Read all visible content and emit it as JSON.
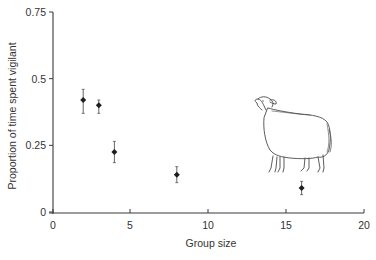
{
  "chart_data": {
    "type": "scatter",
    "title": "",
    "xlabel": "Group size",
    "ylabel": "Proportion of time spent vigilant",
    "xlim": [
      0,
      20
    ],
    "ylim": [
      0,
      0.75
    ],
    "x_ticks": [
      0,
      5,
      10,
      15,
      20
    ],
    "x_tick_labels": [
      "0",
      "5",
      "10",
      "15",
      "20"
    ],
    "y_ticks": [
      0,
      0.25,
      0.5,
      0.75
    ],
    "y_tick_labels": [
      "0",
      "0.25",
      "0.5",
      "0.75"
    ],
    "grid": false,
    "legend": null,
    "series": [
      {
        "name": "Vigilance",
        "marker": "diamond",
        "error_bars": true,
        "points": [
          {
            "x": 2,
            "y": 0.42,
            "err_low": 0.37,
            "err_high": 0.46
          },
          {
            "x": 3,
            "y": 0.4,
            "err_low": 0.37,
            "err_high": 0.42
          },
          {
            "x": 4,
            "y": 0.225,
            "err_low": 0.185,
            "err_high": 0.265
          },
          {
            "x": 8,
            "y": 0.14,
            "err_low": 0.11,
            "err_high": 0.17
          },
          {
            "x": 16,
            "y": 0.09,
            "err_low": 0.065,
            "err_high": 0.115
          }
        ]
      }
    ],
    "annotations": [
      {
        "type": "illustration",
        "subject": "sheep",
        "position": "right-middle"
      }
    ]
  },
  "colors": {
    "axis": "#3a3a3a",
    "marker": "#1e1e1e",
    "error_bar": "#555555",
    "illustration": "#4a4a4a"
  }
}
